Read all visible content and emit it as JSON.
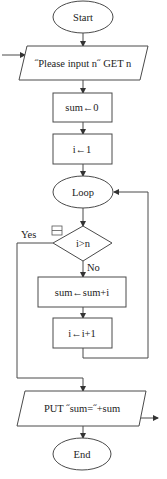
{
  "flowchart": {
    "nodes": {
      "start": {
        "type": "terminal",
        "label": "Start"
      },
      "input": {
        "type": "io",
        "label": "˝Please input n˝ GET n"
      },
      "init_sum": {
        "type": "process",
        "label": "sum←0"
      },
      "init_i": {
        "type": "process",
        "label": "i←1"
      },
      "loop": {
        "type": "terminal",
        "label": "Loop"
      },
      "condition": {
        "type": "decision",
        "label": "i>n"
      },
      "accumulate": {
        "type": "process",
        "label": "sum←sum+i"
      },
      "increment": {
        "type": "process",
        "label": "i←i+1"
      },
      "output": {
        "type": "io",
        "label": "PUT ˝sum=˝+sum"
      },
      "end": {
        "type": "terminal",
        "label": "End"
      }
    },
    "edges": {
      "yes_label": "Yes",
      "no_label": "No"
    },
    "colors": {
      "stroke": "#4a4a4a",
      "fill": "#ffffff",
      "text": "#222222"
    }
  }
}
